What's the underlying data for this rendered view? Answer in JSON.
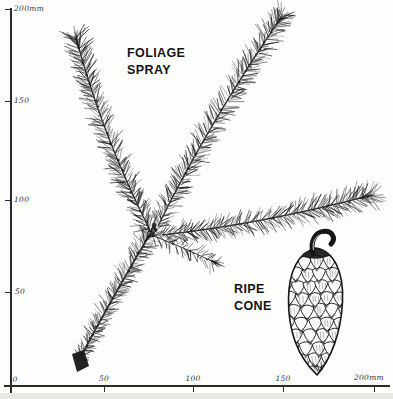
{
  "plate": {
    "ink": "#161616",
    "paper": "#fdfdfc",
    "labels": {
      "foliage_line1": "FOLIAGE",
      "foliage_line2": "SPRAY",
      "cone_line1": "RIPE",
      "cone_line2": "CONE"
    },
    "y_axis": {
      "unit": "mm",
      "ticks": [
        "200mm",
        "150",
        "100",
        "50"
      ]
    },
    "x_axis": {
      "unit": "mm",
      "ticks": [
        "0",
        "50",
        "100",
        "150",
        "200mm"
      ]
    },
    "illustrations": [
      "foliage-spray",
      "ripe-cone"
    ]
  }
}
